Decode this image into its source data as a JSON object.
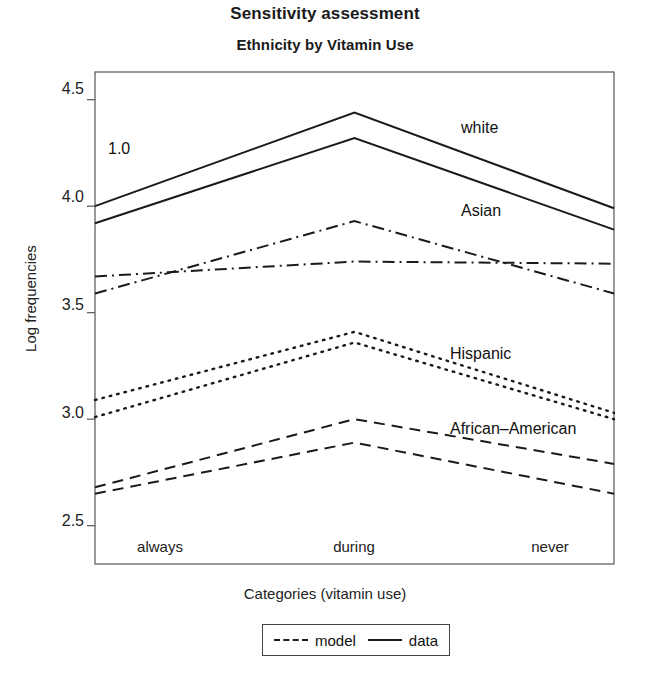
{
  "chart_data": {
    "type": "line",
    "title": "Sensitivity assessment",
    "subtitle": "Ethnicity by Vitamin Use",
    "xlabel": "Categories (vitamin use)",
    "ylabel": "Log frequencies",
    "categories": [
      "always",
      "during",
      "never"
    ],
    "ylim": [
      2.32,
      4.63
    ],
    "yticks": [
      2.5,
      3.0,
      3.5,
      4.0,
      4.5
    ],
    "ytick_labels": [
      "2.5",
      "3.0",
      "3.5",
      "4.0",
      "4.5"
    ],
    "grid": false,
    "legend_position": "below-axis-label",
    "annotations": [
      {
        "text": "1.0",
        "x_category": "always",
        "y": 4.15
      }
    ],
    "groups": [
      {
        "name": "white",
        "label": "white",
        "label_y": 4.31,
        "series": [
          {
            "name": "data",
            "linestyle": "solid",
            "values": [
              4.0,
              4.44,
              3.99
            ]
          },
          {
            "name": "model",
            "linestyle": "solid",
            "values": [
              3.92,
              4.32,
              3.89
            ]
          }
        ]
      },
      {
        "name": "Asian",
        "label": "Asian",
        "label_y": 3.85,
        "series": [
          {
            "name": "data",
            "linestyle": "dashdot",
            "values": [
              3.59,
              3.93,
              3.59
            ]
          },
          {
            "name": "model",
            "linestyle": "dashdot",
            "values": [
              3.67,
              3.74,
              3.73
            ]
          }
        ]
      },
      {
        "name": "Hispanic",
        "label": "Hispanic",
        "label_y": 3.27,
        "series": [
          {
            "name": "data",
            "linestyle": "dotted",
            "values": [
              3.09,
              3.41,
              3.03
            ]
          },
          {
            "name": "model",
            "linestyle": "dotted",
            "values": [
              3.01,
              3.36,
              3.0
            ]
          }
        ]
      },
      {
        "name": "African-American",
        "label": "African–American",
        "label_y": 2.93,
        "series": [
          {
            "name": "data",
            "linestyle": "dashed",
            "values": [
              2.68,
              3.0,
              2.79
            ]
          },
          {
            "name": "model",
            "linestyle": "dashed",
            "values": [
              2.65,
              2.89,
              2.65
            ]
          }
        ]
      }
    ],
    "legend": [
      {
        "label": "model",
        "linestyle": "dashed"
      },
      {
        "label": "data",
        "linestyle": "solid"
      }
    ]
  },
  "axis": {
    "ytick_labels": [
      "4.5",
      "4.0",
      "3.5",
      "3.0",
      "2.5"
    ],
    "xtick_labels": [
      "always",
      "during",
      "never"
    ]
  },
  "series_labels": {
    "white": "white",
    "asian": "Asian",
    "hispanic": "Hispanic",
    "african_american": "African–American"
  },
  "annotation": {
    "value": "1.0"
  },
  "legend": {
    "model_label": "model",
    "data_label": "data"
  },
  "colors": {
    "ink": "#1a1a1a",
    "axis": "#555555",
    "background": "#ffffff"
  }
}
